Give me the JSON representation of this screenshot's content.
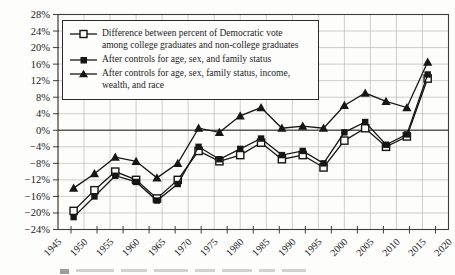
{
  "figure": {
    "background": "#fdfdfc",
    "line_color": "#161616",
    "grid_color": "#b9b9b6",
    "zero_line_color": "#5a5a58",
    "border_color": "#3d3d3b",
    "label_color": "#222222"
  },
  "chart_data": {
    "type": "line",
    "title": "",
    "xlabel": "",
    "ylabel": "",
    "xlim": [
      1945,
      2020
    ],
    "ylim": [
      -24,
      28
    ],
    "grid": true,
    "legend_position": "top-left",
    "x": [
      1948,
      1952,
      1956,
      1960,
      1964,
      1968,
      1972,
      1976,
      1980,
      1984,
      1988,
      1992,
      1996,
      2000,
      2004,
      2008,
      2012,
      2016
    ],
    "series": [
      {
        "name": "Difference between percent of Democratic vote among college graduates and non-college graduates",
        "marker": "square-open",
        "values": [
          -19.5,
          -14.5,
          -10,
          -12,
          -16.5,
          -12,
          -5,
          -7.5,
          -6,
          -3,
          -7,
          -6,
          -9,
          -2.5,
          0.5,
          -4,
          -1.5,
          12.5
        ]
      },
      {
        "name": "After controls for age, sex, and family status",
        "marker": "square-filled",
        "values": [
          -21,
          -16,
          -11,
          -12.5,
          -17,
          -13,
          -4,
          -7,
          -4.5,
          -2,
          -6,
          -5,
          -8,
          -0.5,
          2,
          -3.5,
          -1,
          13.5
        ]
      },
      {
        "name": "After controls for age, sex, family status, income, wealth, and race",
        "marker": "triangle-filled",
        "values": [
          -14,
          -10.5,
          -6.5,
          -7.5,
          -11.5,
          -8,
          0.5,
          -0.5,
          3.5,
          5.5,
          0.5,
          1,
          0.5,
          6,
          9,
          7,
          5.5,
          16.5
        ]
      }
    ],
    "y_ticks": [
      28,
      24,
      20,
      16,
      12,
      8,
      4,
      0,
      -4,
      -8,
      -12,
      -16,
      -20,
      -24
    ],
    "y_tick_labels": [
      "28%",
      "24%",
      "20%",
      "16%",
      "12%",
      "8%",
      "4%",
      "0%",
      "−4%",
      "−8%",
      "−12%",
      "−16%",
      "−20%",
      "−24%"
    ],
    "x_ticks": [
      1945,
      1950,
      1955,
      1960,
      1965,
      1970,
      1975,
      1980,
      1985,
      1990,
      1995,
      2000,
      2005,
      2010,
      2015,
      2020
    ],
    "x_tick_labels": [
      "1945",
      "1950",
      "1955",
      "1960",
      "1965",
      "1970",
      "1975",
      "1980",
      "1985",
      "1990",
      "1995",
      "2000",
      "2005",
      "2010",
      "2015",
      "2020"
    ]
  }
}
